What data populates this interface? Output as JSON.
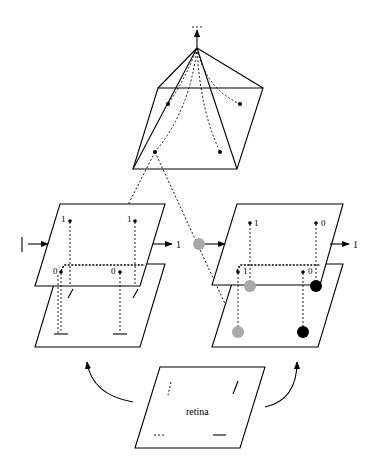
{
  "figure": {
    "type": "diagram",
    "colors": {
      "line": "#000000",
      "background": "#ffffff",
      "gray_unit": "#a8a8a8",
      "black_unit": "#000000"
    }
  },
  "retina": {
    "label": "retina",
    "features": [
      "dotted-vertical-segment",
      "solid-diagonal-segment",
      "dotted-horizontal-segment",
      "solid-horizontal-segment"
    ]
  },
  "left_module": {
    "input_label": "|",
    "output_label": "1",
    "upper_units": [
      {
        "label": "1"
      },
      {
        "label": "1"
      }
    ],
    "lower_units": [
      {
        "label": "0"
      },
      {
        "label": "0"
      }
    ]
  },
  "right_module": {
    "output_label": "1",
    "upper_units": [
      {
        "label": "1"
      },
      {
        "label": "0"
      }
    ],
    "lower_units": [
      {
        "label": "1"
      },
      {
        "label": "0"
      }
    ],
    "activation_circles": [
      "gray",
      "gray",
      "gray",
      "black",
      "black"
    ]
  },
  "pyramid": {
    "units": 4,
    "output": "arrow-up"
  }
}
